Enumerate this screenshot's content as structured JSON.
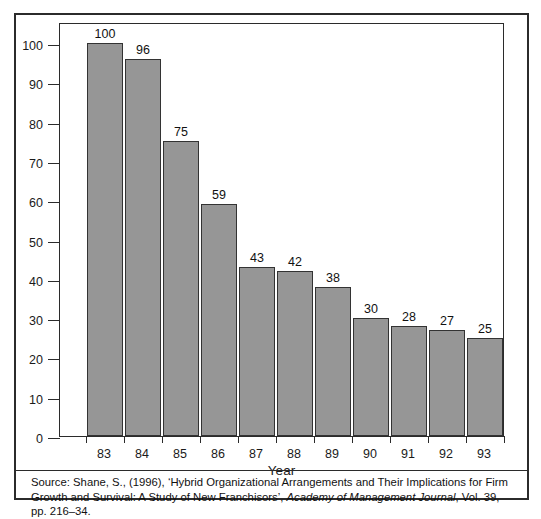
{
  "chart_data": {
    "type": "bar",
    "title": "",
    "subtitle": "",
    "xlabel": "Year",
    "ylabel": "",
    "categories": [
      "83",
      "84",
      "85",
      "86",
      "87",
      "88",
      "89",
      "90",
      "91",
      "92",
      "93"
    ],
    "values": [
      100,
      96,
      75,
      59,
      43,
      42,
      38,
      30,
      28,
      27,
      25
    ],
    "series": [
      {
        "name": "",
        "values": [
          100,
          96,
          75,
          59,
          43,
          42,
          38,
          30,
          28,
          27,
          25
        ]
      }
    ],
    "ylim": [
      0,
      100
    ],
    "xlim_categories": 11,
    "y_ticks": [
      0,
      10,
      20,
      30,
      40,
      50,
      60,
      70,
      80,
      90,
      100
    ],
    "y_tick_labels": [
      "0",
      "10",
      "20",
      "30",
      "40",
      "50",
      "60",
      "70",
      "80",
      "90",
      "100"
    ],
    "x_tick_labels": [
      "83",
      "84",
      "85",
      "86",
      "87",
      "88",
      "89",
      "90",
      "91",
      "92",
      "93"
    ],
    "data_labels": [
      "100",
      "96",
      "75",
      "59",
      "43",
      "42",
      "38",
      "30",
      "28",
      "27",
      "25"
    ],
    "grid": false,
    "legend": null,
    "legend_position": "none",
    "bar_color": "#969696",
    "bar_border_color": "#333333",
    "axis_color": "#2b2b2b",
    "background_color": "#ffffff"
  },
  "source_note": {
    "part1": "Source: Shane, S., (1996), ‘Hybrid Organizational Arrangements and Their Implications for Firm Growth and Survival: A Study of New Franchisors’, ",
    "journal": "Academy of Management Journal",
    "part2": ", Vol. 39, pp. 216–34."
  }
}
